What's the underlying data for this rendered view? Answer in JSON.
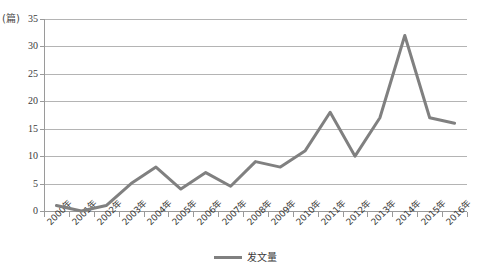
{
  "chart_data": {
    "type": "line",
    "title": "",
    "xlabel": "",
    "ylabel": "",
    "unit_label": "(篇)",
    "categories": [
      "2000年",
      "2001年",
      "2002年",
      "2003年",
      "2004年",
      "2005年",
      "2006年",
      "2007年",
      "2008年",
      "2009年",
      "2010年",
      "2011年",
      "2012年",
      "2013年",
      "2014年",
      "2015年",
      "2016年"
    ],
    "series": [
      {
        "name": "发文量",
        "color": "#808080",
        "values": [
          1,
          0,
          1,
          5,
          8,
          4,
          7,
          4.5,
          9,
          8,
          11,
          18,
          10,
          17,
          32,
          17,
          16
        ]
      }
    ],
    "ylim": [
      0,
      35
    ],
    "yticks": [
      0,
      5,
      10,
      15,
      20,
      25,
      30,
      35
    ],
    "ytick_labels": [
      "0",
      "5",
      "10",
      "15",
      "20",
      "25",
      "30",
      "35"
    ],
    "grid": true,
    "legend_position": "bottom"
  },
  "legend": {
    "entries": [
      {
        "label": "发文量"
      }
    ]
  }
}
